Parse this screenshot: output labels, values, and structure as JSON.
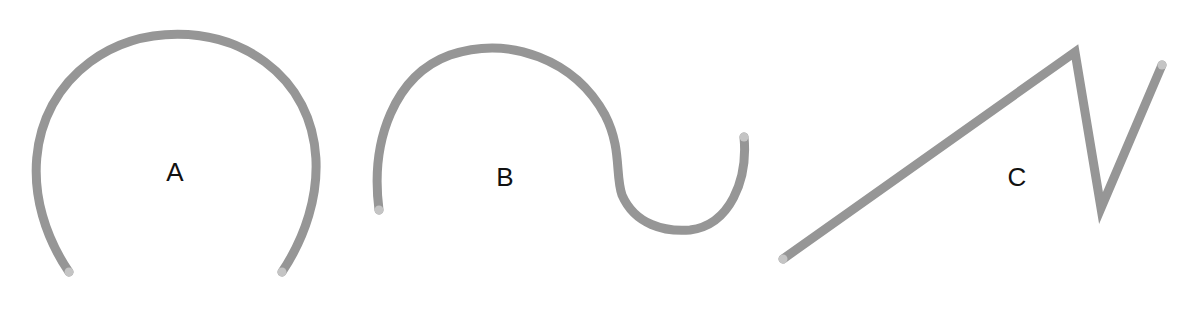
{
  "diagram": {
    "colors": {
      "stroke": "#969696",
      "endpoint": "#c4c4c4",
      "label": "#111111",
      "background": "#ffffff"
    },
    "shapes": [
      {
        "id": "A",
        "label": "A",
        "kind": "open arc (horseshoe)",
        "label_pos": [
          175,
          172
        ],
        "endpoints": [
          [
            69,
            272
          ],
          [
            282,
            272
          ]
        ]
      },
      {
        "id": "B",
        "label": "B",
        "kind": "S-curve (large arc then small hook)",
        "label_pos": [
          505,
          175
        ],
        "endpoints": [
          [
            379,
            210
          ],
          [
            744,
            137
          ]
        ]
      },
      {
        "id": "C",
        "label": "C",
        "kind": "zigzag polyline",
        "label_pos": [
          1015,
          175
        ],
        "endpoints": [
          [
            783,
            259
          ],
          [
            1162,
            65
          ]
        ],
        "vertices": [
          [
            783,
            259
          ],
          [
            1075,
            50
          ],
          [
            1103,
            210
          ],
          [
            1162,
            65
          ]
        ]
      }
    ]
  }
}
